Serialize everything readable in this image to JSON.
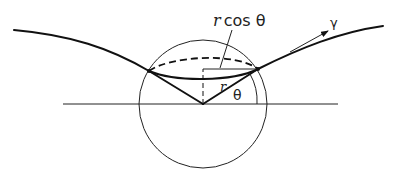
{
  "diagram": {
    "labels": {
      "rcos_r": "r",
      "rcos_rest": "cos θ",
      "gamma": "γ",
      "theta": "θ",
      "radius": "r"
    },
    "colors": {
      "line": "#111111",
      "background": "#ffffff"
    }
  }
}
